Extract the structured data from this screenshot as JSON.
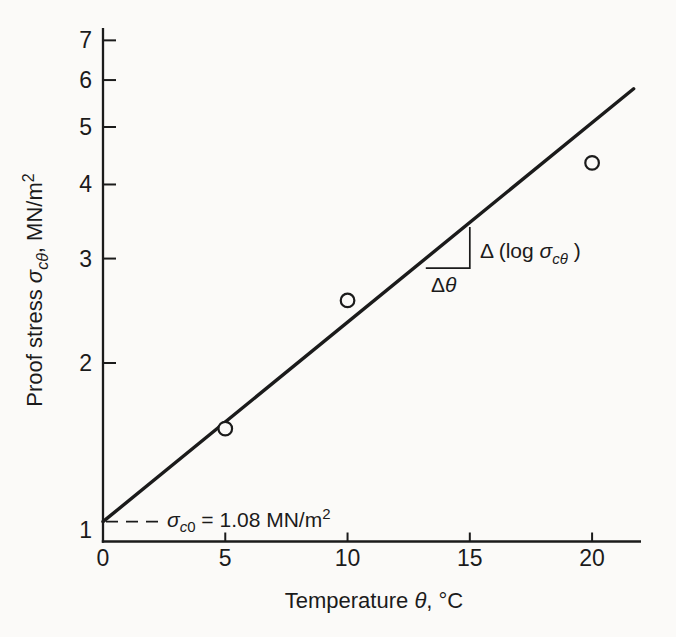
{
  "figure": {
    "background_color": "#fbfaf8",
    "ink_color": "#1b1b1b"
  },
  "chart_data": {
    "type": "scatter",
    "title": "",
    "grid": false,
    "legend": null,
    "marker": "open-circle",
    "x_axis": {
      "scale": "linear",
      "min": 0,
      "max": 22,
      "ticks": [
        0,
        5,
        10,
        15,
        20
      ],
      "label_plain": "Temperature θ, °C",
      "label_tokens": [
        {
          "t": "Temperature "
        },
        {
          "t": "θ",
          "i": 1
        },
        {
          "t": ", °C"
        }
      ]
    },
    "y_axis": {
      "scale": "log",
      "min": 1,
      "max": 7.5,
      "ticks": [
        7,
        6,
        5,
        4,
        3,
        2,
        1
      ],
      "label_plain": "Proof stress σcθ, MN/m2",
      "label_tokens": [
        {
          "t": "Proof stress "
        },
        {
          "t": "σ",
          "i": 1
        },
        {
          "t": "cθ",
          "i": 1,
          "sub": 1
        },
        {
          "t": ", MN/m"
        },
        {
          "t": "2",
          "sup": 1
        }
      ]
    },
    "points": [
      {
        "theta": 5,
        "sigma": 1.55
      },
      {
        "theta": 10,
        "sigma": 2.55
      },
      {
        "theta": 20,
        "sigma": 4.35
      }
    ],
    "fit_line": {
      "theta_start": 0,
      "sigma_start": 1.08,
      "theta_end": 21.7,
      "sigma_end": 5.8
    },
    "slope_triangle": {
      "theta1": 13.2,
      "theta2": 15,
      "sigma_base": 2.89,
      "sigma_top": 3.39
    },
    "annotations": {
      "intercept": {
        "plain": "σc0 = 1.08 MN/m2",
        "value": "1.08",
        "tokens": [
          {
            "t": "σ",
            "i": 1
          },
          {
            "t": "c",
            "i": 1,
            "sub": 1
          },
          {
            "t": "0",
            "sub": 1
          },
          {
            "t": " = 1.08 MN/m"
          },
          {
            "t": "2",
            "sup": 1
          }
        ]
      },
      "slope_rise": {
        "plain": "Δ (log σcθ )",
        "tokens": [
          {
            "t": "Δ (log "
          },
          {
            "t": "σ",
            "i": 1
          },
          {
            "t": "cθ",
            "i": 1,
            "sub": 1
          },
          {
            "t": " )"
          }
        ]
      },
      "slope_run": {
        "plain": "Δθ",
        "tokens": [
          {
            "t": "Δ"
          },
          {
            "t": "θ",
            "i": 1
          }
        ]
      }
    }
  }
}
